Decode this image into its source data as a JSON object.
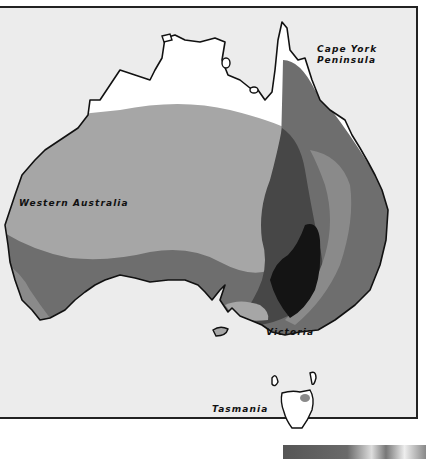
{
  "map": {
    "subject": "Australia",
    "labels": {
      "cape_york": [
        "Cape York",
        "Peninsula"
      ],
      "western_australia": "Western Australia",
      "victoria": "Victoria",
      "tasmania": "Tasmania"
    },
    "shading_colors": {
      "ocean": "#ececec",
      "unshaded": "#ffffff",
      "light": "#a6a6a6",
      "medium": "#8a8a8a",
      "medium_dark": "#6e6e6e",
      "dark": "#474747",
      "darkest": "#141414"
    }
  }
}
